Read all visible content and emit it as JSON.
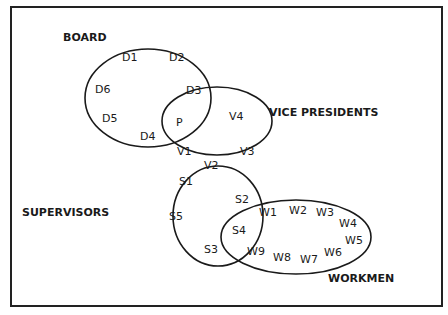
{
  "diagram": {
    "type": "venn",
    "colors": {
      "line": "#1a1a1a",
      "background": "#ffffff"
    },
    "groups": [
      {
        "id": "board",
        "label": "BOARD",
        "members": [
          "D1",
          "D2",
          "D3",
          "D4",
          "D5",
          "D6",
          "P"
        ]
      },
      {
        "id": "vp",
        "label": "VICE PRESIDENTS",
        "members": [
          "P",
          "V1",
          "V2",
          "V3",
          "V4"
        ]
      },
      {
        "id": "supervisors",
        "label": "SUPERVISORS",
        "members": [
          "V2",
          "S1",
          "S2",
          "S3",
          "S4",
          "S5"
        ]
      },
      {
        "id": "workmen",
        "label": "WORKMEN",
        "members": [
          "S4",
          "W1",
          "W2",
          "W3",
          "W4",
          "W5",
          "W6",
          "W7",
          "W8",
          "W9"
        ]
      }
    ],
    "nodes": {
      "D1": "D1",
      "D2": "D2",
      "D3": "D3",
      "D4": "D4",
      "D5": "D5",
      "D6": "D6",
      "P": "P",
      "V1": "V1",
      "V2": "V2",
      "V3": "V3",
      "V4": "V4",
      "S1": "S1",
      "S2": "S2",
      "S3": "S3",
      "S4": "S4",
      "S5": "S5",
      "W1": "W1",
      "W2": "W2",
      "W3": "W3",
      "W4": "W4",
      "W5": "W5",
      "W6": "W6",
      "W7": "W7",
      "W8": "W8",
      "W9": "W9"
    }
  }
}
